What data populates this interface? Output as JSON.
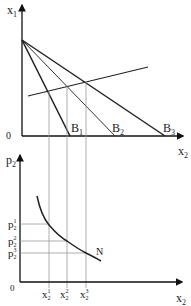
{
  "upper_graph": {
    "y_axis_label": "x",
    "y_axis_sub": "1",
    "x_axis_label": "x",
    "x_axis_sub": "2",
    "origin_label": "0",
    "budget_lines": [
      {
        "label": "B",
        "sub": "1"
      },
      {
        "label": "B",
        "sub": "2"
      },
      {
        "label": "B",
        "sub": "3"
      }
    ]
  },
  "lower_graph": {
    "y_axis_label": "p",
    "y_axis_sub": "2",
    "x_axis_label": "x",
    "x_axis_sub": "2",
    "origin_label": "0",
    "curve_label": "N",
    "price_ticks": [
      {
        "label": "p",
        "sub": "2",
        "sup": "1"
      },
      {
        "label": "p",
        "sub": "2",
        "sup": "2"
      },
      {
        "label": "p",
        "sub": "2",
        "sup": "3"
      }
    ],
    "quantity_ticks": [
      {
        "label": "x",
        "sub": "2",
        "sup": "1"
      },
      {
        "label": "x",
        "sub": "2",
        "sup": "2"
      },
      {
        "label": "x",
        "sub": "2",
        "sup": "3"
      }
    ]
  },
  "colors": {
    "axis": "#111111",
    "guide": "#9a9a9a",
    "curve": "#222222"
  }
}
